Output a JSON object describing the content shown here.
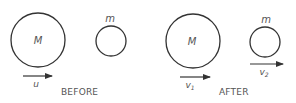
{
  "diagram": {
    "colors": {
      "stroke": "#333333",
      "text": "#555555",
      "background": "#ffffff"
    },
    "panels": [
      {
        "caption": "BEFORE",
        "large_body": {
          "label": "M",
          "velocity_label": "u",
          "velocity_sub": ""
        },
        "small_body": {
          "label": "m",
          "velocity_label": "",
          "velocity_sub": ""
        }
      },
      {
        "caption": "AFTER",
        "large_body": {
          "label": "M",
          "velocity_label": "v",
          "velocity_sub": "1"
        },
        "small_body": {
          "label": "m",
          "velocity_label": "v",
          "velocity_sub": "2"
        }
      }
    ]
  }
}
